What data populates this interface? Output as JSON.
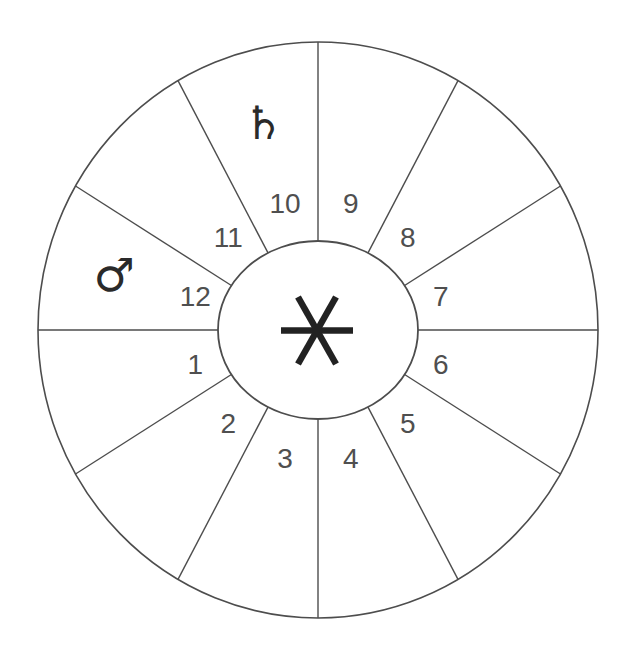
{
  "figure": {
    "kind": "astrological-house-wheel",
    "houses": [
      {
        "number": "1"
      },
      {
        "number": "2"
      },
      {
        "number": "3"
      },
      {
        "number": "4"
      },
      {
        "number": "5"
      },
      {
        "number": "6"
      },
      {
        "number": "7"
      },
      {
        "number": "8"
      },
      {
        "number": "9"
      },
      {
        "number": "10"
      },
      {
        "number": "11"
      },
      {
        "number": "12"
      }
    ],
    "planets": [
      {
        "name": "saturn",
        "glyph": "♄",
        "house": 10
      },
      {
        "name": "mars",
        "glyph": "♂",
        "house": 12
      }
    ],
    "center_symbol": {
      "name": "six-ray-asterisk",
      "rays": 6
    },
    "colors": {
      "background": "#ffffff",
      "line": "#4d4d4d",
      "number": "#4f4f4f",
      "glyph": "#2a2a2a",
      "asterisk": "#222222"
    }
  }
}
